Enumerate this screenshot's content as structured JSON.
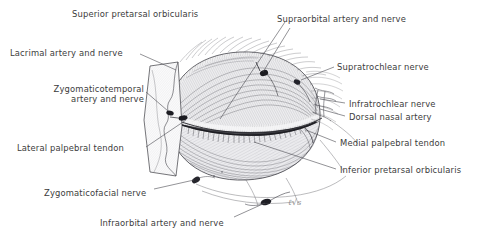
{
  "figure": {
    "background_color": "#ffffff",
    "ink_color": "#3b3b3b",
    "width": 486,
    "height": 239,
    "style": "pen-and-ink stipple and hatch medical illustration"
  },
  "signature": {
    "text": "ℓ√s",
    "description": "artist monogram lower-centre-right"
  },
  "labels": [
    {
      "id": "superior-pretarsal-orbicularis",
      "text": "Superior pretarsal orbicularis",
      "align": "left",
      "x": 72,
      "y": 9,
      "leader_from": [
        285,
        22
      ],
      "leader_to": [
        220,
        119
      ]
    },
    {
      "id": "supraorbital-artery-and-nerve",
      "text": "Supraorbital artery and nerve",
      "align": "left",
      "x": 277,
      "y": 14,
      "leader_from": [
        290,
        28
      ],
      "leader_to": [
        263,
        72
      ]
    },
    {
      "id": "lacrimal-artery-and-nerve",
      "text": "Lacrimal artery and nerve",
      "align": "left",
      "x": 10,
      "y": 48,
      "leader_from": [
        140,
        54
      ],
      "leader_to": [
        175,
        70
      ]
    },
    {
      "id": "supratrochlear-nerve",
      "text": "Supratrochlear nerve",
      "align": "left",
      "x": 337,
      "y": 62,
      "leader_from": [
        331,
        67
      ],
      "leader_to": [
        300,
        79
      ]
    },
    {
      "id": "zygomaticotemporal-artery-and-nerve",
      "text": "Zygomaticotemporal artery and nerve",
      "line1": "Zygomaticotemporal",
      "line2": "artery and nerve",
      "align": "right",
      "x": 22,
      "y": 84,
      "leader_from": [
        144,
        92
      ],
      "leader_to": [
        168,
        112
      ]
    },
    {
      "id": "infratrochlear-nerve",
      "text": "Infratrochlear nerve",
      "align": "left",
      "x": 349,
      "y": 99,
      "leader_from": [
        342,
        104
      ],
      "leader_to": [
        318,
        101
      ]
    },
    {
      "id": "dorsal-nasal-artery",
      "text": "Dorsal nasal artery",
      "align": "left",
      "x": 349,
      "y": 112,
      "leader_from": [
        343,
        116
      ],
      "leader_to": [
        318,
        110
      ]
    },
    {
      "id": "medial-palpebral-tendon",
      "text": "Medial palpebral tendon",
      "align": "left",
      "x": 340,
      "y": 138,
      "leader_from": [
        334,
        142
      ],
      "leader_to": [
        304,
        131
      ]
    },
    {
      "id": "lateral-palpebral-tendon",
      "text": "Lateral palpebral tendon",
      "align": "left",
      "x": 17,
      "y": 143,
      "leader_from": [
        144,
        147
      ],
      "leader_to": [
        186,
        120
      ]
    },
    {
      "id": "inferior-pretarsal-orbicularis",
      "text": "Inferior pretarsal orbicularis",
      "align": "left",
      "x": 340,
      "y": 165,
      "leader_from": [
        334,
        169
      ],
      "leader_to": [
        253,
        143
      ]
    },
    {
      "id": "zygomaticofacial-nerve",
      "text": "Zygomaticofacial nerve",
      "align": "left",
      "x": 44,
      "y": 188,
      "leader_from": [
        152,
        189
      ],
      "leader_to": [
        193,
        180
      ]
    },
    {
      "id": "infraorbital-artery-and-nerve",
      "text": "Infraorbital artery and nerve",
      "align": "left",
      "x": 100,
      "y": 218,
      "leader_from": [
        232,
        217
      ],
      "leader_to": [
        266,
        203
      ]
    }
  ],
  "structures": [
    {
      "id": "orbital-rim-outline",
      "name": "Orbital rim and eyelid complex outline"
    },
    {
      "id": "upper-eyelid",
      "name": "Upper eyelid with pretarsal orbicularis fibres"
    },
    {
      "id": "lower-eyelid",
      "name": "Lower eyelid with pretarsal orbicularis fibres"
    },
    {
      "id": "palpebral-fissure",
      "name": "Palpebral fissure with eyelash row"
    },
    {
      "id": "temporal-flap",
      "name": "Reflected lateral skin flap"
    },
    {
      "id": "medial-canthal-vessels",
      "name": "Medial canthal vascular arcade"
    },
    {
      "id": "supraorbital-foramen-bundle",
      "name": "Supraorbital neurovascular bundle"
    },
    {
      "id": "infraorbital-foramen-bundle",
      "name": "Infraorbital neurovascular bundle"
    },
    {
      "id": "zygomaticofacial-foramen-bundle",
      "name": "Zygomaticofacial neurovascular bundle"
    }
  ]
}
